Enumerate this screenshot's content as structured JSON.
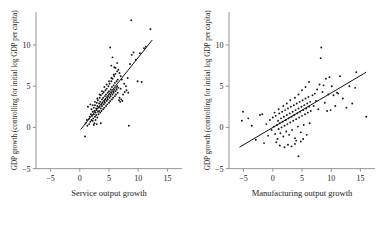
{
  "figure": {
    "background": "#ffffff",
    "point_color": "#141414",
    "line_color": "#111111",
    "axis_color": "#8a8a8a"
  },
  "chart_data": [
    {
      "type": "scatter",
      "panel": "left",
      "title": "",
      "xlabel": "Service output growth",
      "ylabel": "GDP growth (controlling for initial log GDP per capita)",
      "xlim": [
        -7.5,
        17.5
      ],
      "ylim": [
        -6.5,
        14
      ],
      "xticks": [
        -5,
        0,
        5,
        10,
        15
      ],
      "yticks": [
        -5,
        0,
        5,
        10
      ],
      "xtick_labels": [
        "−5",
        "0",
        "5",
        "10",
        "15"
      ],
      "ytick_labels": [
        "−5",
        "0",
        "5",
        "10"
      ],
      "grid": false,
      "legend": "none",
      "fit_line": {
        "x": [
          0.15,
          12.4
        ],
        "y": [
          -0.25,
          10.6
        ]
      },
      "points": [
        [
          0.9,
          -1.1
        ],
        [
          1.0,
          0.5
        ],
        [
          1.2,
          0.9
        ],
        [
          1.3,
          0.2
        ],
        [
          1.5,
          1.0
        ],
        [
          1.6,
          0.4
        ],
        [
          1.7,
          1.3
        ],
        [
          1.8,
          0.7
        ],
        [
          1.9,
          1.6
        ],
        [
          2.0,
          0.9
        ],
        [
          2.0,
          2.2
        ],
        [
          2.1,
          1.4
        ],
        [
          2.2,
          0.8
        ],
        [
          2.2,
          1.9
        ],
        [
          2.3,
          1.1
        ],
        [
          2.4,
          2.4
        ],
        [
          2.4,
          1.6
        ],
        [
          2.5,
          0.5
        ],
        [
          2.5,
          2.0
        ],
        [
          2.6,
          1.3
        ],
        [
          2.6,
          2.7
        ],
        [
          2.7,
          1.8
        ],
        [
          2.7,
          0.9
        ],
        [
          2.8,
          2.3
        ],
        [
          2.8,
          1.5
        ],
        [
          2.9,
          3.0
        ],
        [
          2.9,
          2.1
        ],
        [
          3.0,
          1.2
        ],
        [
          3.0,
          2.6
        ],
        [
          3.1,
          1.9
        ],
        [
          3.1,
          3.3
        ],
        [
          3.2,
          2.4
        ],
        [
          3.2,
          1.6
        ],
        [
          3.3,
          2.9
        ],
        [
          3.3,
          2.0
        ],
        [
          3.4,
          3.6
        ],
        [
          3.4,
          2.5
        ],
        [
          3.5,
          1.8
        ],
        [
          3.5,
          3.1
        ],
        [
          3.6,
          2.3
        ],
        [
          3.6,
          3.9
        ],
        [
          3.7,
          2.8
        ],
        [
          3.7,
          2.0
        ],
        [
          3.8,
          3.4
        ],
        [
          3.8,
          2.6
        ],
        [
          3.9,
          4.1
        ],
        [
          3.9,
          3.0
        ],
        [
          4.0,
          2.2
        ],
        [
          4.0,
          3.6
        ],
        [
          4.1,
          2.8
        ],
        [
          4.1,
          4.3
        ],
        [
          4.2,
          3.2
        ],
        [
          4.2,
          2.4
        ],
        [
          4.3,
          3.8
        ],
        [
          4.3,
          3.0
        ],
        [
          4.4,
          4.5
        ],
        [
          4.4,
          3.4
        ],
        [
          4.5,
          2.6
        ],
        [
          4.5,
          4.0
        ],
        [
          4.6,
          3.2
        ],
        [
          4.6,
          4.7
        ],
        [
          4.7,
          3.6
        ],
        [
          4.7,
          2.8
        ],
        [
          4.8,
          4.2
        ],
        [
          4.8,
          3.4
        ],
        [
          4.9,
          5.0
        ],
        [
          4.9,
          3.8
        ],
        [
          5.0,
          3.0
        ],
        [
          5.0,
          4.4
        ],
        [
          5.1,
          3.6
        ],
        [
          5.1,
          5.3
        ],
        [
          5.2,
          4.0
        ],
        [
          5.2,
          3.2
        ],
        [
          5.3,
          4.6
        ],
        [
          5.3,
          3.8
        ],
        [
          5.4,
          5.6
        ],
        [
          5.4,
          4.2
        ],
        [
          5.5,
          3.4
        ],
        [
          5.5,
          4.9
        ],
        [
          5.6,
          4.0
        ],
        [
          5.6,
          5.9
        ],
        [
          5.7,
          4.4
        ],
        [
          5.7,
          3.6
        ],
        [
          5.8,
          5.1
        ],
        [
          5.8,
          4.2
        ],
        [
          5.9,
          6.2
        ],
        [
          5.9,
          4.6
        ],
        [
          6.0,
          3.8
        ],
        [
          6.0,
          5.4
        ],
        [
          6.1,
          4.4
        ],
        [
          6.1,
          6.5
        ],
        [
          6.2,
          4.8
        ],
        [
          6.2,
          4.0
        ],
        [
          6.3,
          5.6
        ],
        [
          6.3,
          4.6
        ],
        [
          6.4,
          6.8
        ],
        [
          6.4,
          5.0
        ],
        [
          6.5,
          4.2
        ],
        [
          6.5,
          5.8
        ],
        [
          6.6,
          4.8
        ],
        [
          4.2,
          4.9
        ],
        [
          4.6,
          5.2
        ],
        [
          5.0,
          5.6
        ],
        [
          5.4,
          6.0
        ],
        [
          5.8,
          6.4
        ],
        [
          3.8,
          4.4
        ],
        [
          3.4,
          4.0
        ],
        [
          3.0,
          3.5
        ],
        [
          2.6,
          3.1
        ],
        [
          2.2,
          2.7
        ],
        [
          5.2,
          9.7
        ],
        [
          5.6,
          8.5
        ],
        [
          5.4,
          7.5
        ],
        [
          5.9,
          7.3
        ],
        [
          6.1,
          7.2
        ],
        [
          6.4,
          7.8
        ],
        [
          6.6,
          7.0
        ],
        [
          6.8,
          6.6
        ],
        [
          7.0,
          6.2
        ],
        [
          7.2,
          5.8
        ],
        [
          6.7,
          3.3
        ],
        [
          6.9,
          3.1
        ],
        [
          7.1,
          3.4
        ],
        [
          6.8,
          3.6
        ],
        [
          7.3,
          3.2
        ],
        [
          7.6,
          5.3
        ],
        [
          7.9,
          5.0
        ],
        [
          8.2,
          6.0
        ],
        [
          8.4,
          0.2
        ],
        [
          8.6,
          7.7
        ],
        [
          8.8,
          13.0
        ],
        [
          8.9,
          8.8
        ],
        [
          9.2,
          9.1
        ],
        [
          9.6,
          8.2
        ],
        [
          9.9,
          5.6
        ],
        [
          10.3,
          9.0
        ],
        [
          10.6,
          5.5
        ],
        [
          11.0,
          9.6
        ],
        [
          11.3,
          9.8
        ],
        [
          12.1,
          11.9
        ],
        [
          7.4,
          4.0
        ],
        [
          7.7,
          4.3
        ],
        [
          8.0,
          4.5
        ],
        [
          8.3,
          4.2
        ],
        [
          7.0,
          4.7
        ],
        [
          1.4,
          2.5
        ],
        [
          1.8,
          2.8
        ],
        [
          2.4,
          0.3
        ],
        [
          2.9,
          0.4
        ],
        [
          3.6,
          0.5
        ]
      ]
    },
    {
      "type": "scatter",
      "panel": "right",
      "title": "",
      "xlabel": "Manufacturing output growth",
      "ylabel": "GDP growth (controlling for initial log GDP per capita)",
      "xlim": [
        -7.5,
        17.5
      ],
      "ylim": [
        -6.5,
        14
      ],
      "xticks": [
        -5,
        0,
        5,
        10,
        15
      ],
      "yticks": [
        -5,
        0,
        5,
        10
      ],
      "xtick_labels": [
        "−5",
        "0",
        "5",
        "10",
        "15"
      ],
      "ytick_labels": [
        "−5",
        "0",
        "5",
        "10"
      ],
      "grid": false,
      "legend": "none",
      "fit_line": {
        "x": [
          -5.7,
          16.0
        ],
        "y": [
          -2.4,
          6.7
        ]
      },
      "points": [
        [
          -5.1,
          1.9
        ],
        [
          -5.3,
          0.8
        ],
        [
          -4.2,
          1.1
        ],
        [
          -3.6,
          0.2
        ],
        [
          -2.9,
          -1.5
        ],
        [
          -2.2,
          1.5
        ],
        [
          -1.8,
          1.6
        ],
        [
          -1.5,
          -1.9
        ],
        [
          -1.1,
          0.4
        ],
        [
          -0.8,
          -1.0
        ],
        [
          -0.5,
          0.9
        ],
        [
          -0.2,
          -0.3
        ],
        [
          0.0,
          1.2
        ],
        [
          0.2,
          0.1
        ],
        [
          0.4,
          -0.8
        ],
        [
          0.5,
          1.4
        ],
        [
          0.7,
          0.3
        ],
        [
          0.8,
          -1.4
        ],
        [
          0.9,
          0.8
        ],
        [
          1.0,
          -0.2
        ],
        [
          1.1,
          1.7
        ],
        [
          1.2,
          0.5
        ],
        [
          1.3,
          -0.7
        ],
        [
          1.4,
          1.1
        ],
        [
          1.5,
          0.0
        ],
        [
          1.6,
          1.9
        ],
        [
          1.7,
          0.7
        ],
        [
          1.8,
          -1.1
        ],
        [
          1.9,
          1.3
        ],
        [
          2.0,
          0.2
        ],
        [
          2.1,
          2.1
        ],
        [
          2.2,
          0.9
        ],
        [
          2.3,
          -0.5
        ],
        [
          2.4,
          1.5
        ],
        [
          2.5,
          0.4
        ],
        [
          2.6,
          2.3
        ],
        [
          2.7,
          1.1
        ],
        [
          2.8,
          -0.9
        ],
        [
          2.9,
          1.7
        ],
        [
          3.0,
          0.6
        ],
        [
          3.1,
          2.5
        ],
        [
          3.2,
          1.3
        ],
        [
          3.3,
          -0.3
        ],
        [
          3.4,
          1.9
        ],
        [
          3.5,
          0.8
        ],
        [
          3.6,
          2.7
        ],
        [
          3.7,
          1.5
        ],
        [
          3.8,
          -1.3
        ],
        [
          3.9,
          2.1
        ],
        [
          4.0,
          1.0
        ],
        [
          4.1,
          2.9
        ],
        [
          4.2,
          1.7
        ],
        [
          4.3,
          0.1
        ],
        [
          4.4,
          2.3
        ],
        [
          4.5,
          1.2
        ],
        [
          4.6,
          3.1
        ],
        [
          4.7,
          1.9
        ],
        [
          4.8,
          -0.6
        ],
        [
          4.9,
          2.5
        ],
        [
          5.0,
          1.4
        ],
        [
          5.1,
          3.3
        ],
        [
          5.2,
          2.1
        ],
        [
          5.3,
          0.3
        ],
        [
          5.4,
          2.7
        ],
        [
          5.5,
          1.6
        ],
        [
          5.6,
          3.5
        ],
        [
          5.7,
          2.3
        ],
        [
          5.8,
          -0.9
        ],
        [
          5.9,
          2.9
        ],
        [
          6.0,
          1.8
        ],
        [
          6.1,
          3.7
        ],
        [
          6.2,
          2.5
        ],
        [
          6.3,
          0.5
        ],
        [
          6.4,
          3.1
        ],
        [
          6.5,
          2.0
        ],
        [
          2.0,
          -2.4
        ],
        [
          2.6,
          -2.1
        ],
        [
          3.2,
          -2.3
        ],
        [
          3.8,
          -2.0
        ],
        [
          4.4,
          -3.5
        ],
        [
          1.2,
          -2.2
        ],
        [
          0.6,
          -1.8
        ],
        [
          4.0,
          -1.6
        ],
        [
          4.8,
          -1.7
        ],
        [
          5.2,
          -1.4
        ],
        [
          6.8,
          3.9
        ],
        [
          7.0,
          2.6
        ],
        [
          7.2,
          4.1
        ],
        [
          7.4,
          3.2
        ],
        [
          7.6,
          4.6
        ],
        [
          7.8,
          2.2
        ],
        [
          8.0,
          5.2
        ],
        [
          8.2,
          8.4
        ],
        [
          8.3,
          9.7
        ],
        [
          8.5,
          4.3
        ],
        [
          8.7,
          5.1
        ],
        [
          8.9,
          3.0
        ],
        [
          9.1,
          5.9
        ],
        [
          9.3,
          2.0
        ],
        [
          9.5,
          4.0
        ],
        [
          9.7,
          6.1
        ],
        [
          9.9,
          2.1
        ],
        [
          10.1,
          5.0
        ],
        [
          10.4,
          3.9
        ],
        [
          10.7,
          2.6
        ],
        [
          11.0,
          4.2
        ],
        [
          11.2,
          4.1
        ],
        [
          11.5,
          6.2
        ],
        [
          12.0,
          3.5
        ],
        [
          12.6,
          2.4
        ],
        [
          13.1,
          5.0
        ],
        [
          13.6,
          2.9
        ],
        [
          14.1,
          4.8
        ],
        [
          14.3,
          6.7
        ],
        [
          16.0,
          1.3
        ],
        [
          5.0,
          4.5
        ],
        [
          5.6,
          4.9
        ],
        [
          6.2,
          5.5
        ],
        [
          4.4,
          4.0
        ],
        [
          3.8,
          3.6
        ],
        [
          3.0,
          3.3
        ],
        [
          2.4,
          2.9
        ],
        [
          1.8,
          2.6
        ],
        [
          1.0,
          2.2
        ],
        [
          0.3,
          1.8
        ]
      ]
    }
  ]
}
